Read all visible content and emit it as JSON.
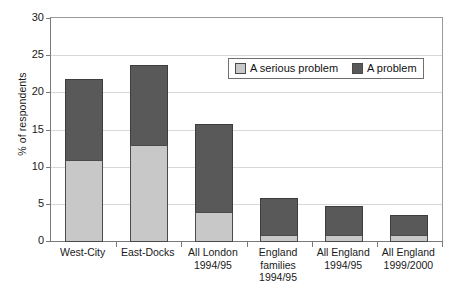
{
  "chart_data": {
    "type": "bar",
    "subtype": "stacked-vertical",
    "title": "",
    "xlabel": "",
    "ylabel": "% of respondents",
    "ylim": [
      0,
      30
    ],
    "yticks": [
      0,
      5,
      10,
      15,
      20,
      25,
      30
    ],
    "ytick_labels": [
      "0",
      "5",
      "10",
      "15",
      "20",
      "25",
      "30"
    ],
    "grid": "horizontal",
    "legend_position": "upper-center",
    "categories": [
      "West-City",
      "East-Docks",
      "All London 1994/95",
      "England families 1994/95",
      "All England 1994/95",
      "All England 1999/2000"
    ],
    "category_lines": [
      [
        "West-City"
      ],
      [
        "East-Docks"
      ],
      [
        "All London",
        "1994/95"
      ],
      [
        "England",
        "families",
        "1994/95"
      ],
      [
        "All England",
        "1994/95"
      ],
      [
        "All England",
        "1999/2000"
      ]
    ],
    "series": [
      {
        "name": "A serious problem",
        "color": "#c8c8c8",
        "values": [
          11,
          13,
          4,
          1,
          1,
          1
        ]
      },
      {
        "name": "A problem",
        "color": "#595959",
        "values": [
          11,
          11,
          12,
          5,
          4,
          2.8
        ]
      }
    ],
    "totals": [
      22,
      24,
      16,
      6,
      5,
      3.8
    ]
  },
  "axis": {
    "y_title": "% of respondents"
  },
  "legend": {
    "entries": [
      {
        "label": "A serious problem",
        "swatch": "serious"
      },
      {
        "label": "A problem",
        "swatch": "problem"
      }
    ]
  },
  "colors": {
    "serious_problem": "#c8c8c8",
    "problem": "#595959",
    "axis": "#7a7a7a",
    "gridline": "#d8d8d8",
    "text": "#1a1a1a"
  }
}
